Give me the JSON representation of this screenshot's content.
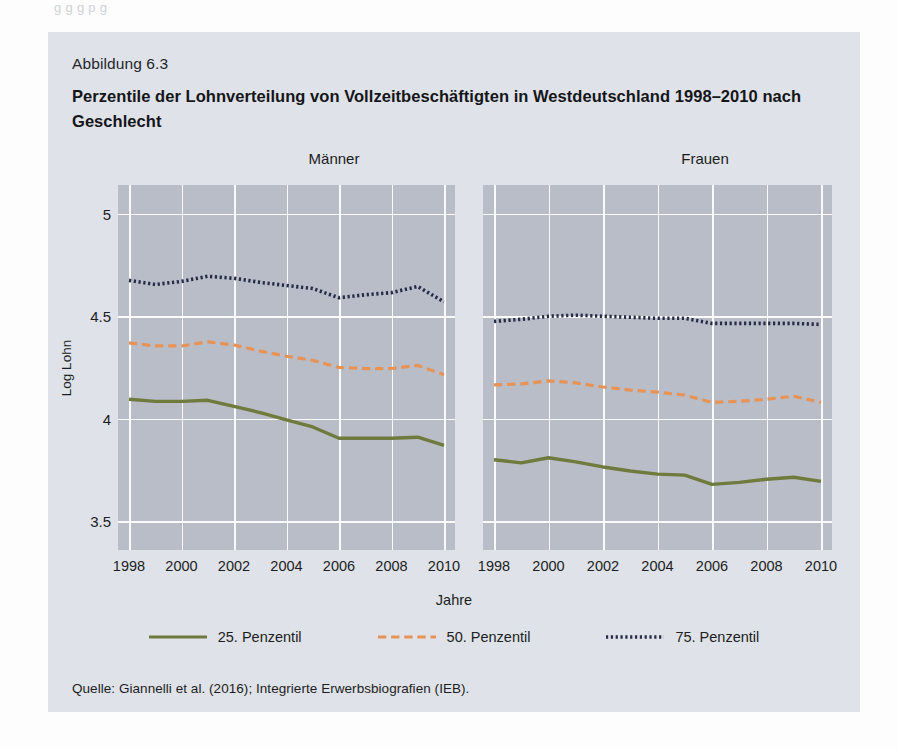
{
  "page_ghost_text": "g  g  g  p  g",
  "figure": {
    "number": "Abbildung 6.3",
    "title": "Perzentile der Lohnverteilung von Vollzeitbeschäftigten in Westdeutschland 1998–2010 nach Geschlecht",
    "source": "Quelle: Giannelli et al. (2016); Integrierte Erwerbsbiografien (IEB).",
    "background_color": "#dfe2e8",
    "plot_background_color": "#b9bdc8"
  },
  "chart_data": {
    "type": "line",
    "title": "Perzentile der Lohnverteilung von Vollzeitbeschäftigten in Westdeutschland 1998–2010 nach Geschlecht",
    "subtitle": "Abbildung 6.3",
    "xlabel": "Jahre",
    "ylabel": "Log Lohn",
    "x": [
      1998,
      1999,
      2000,
      2001,
      2002,
      2003,
      2004,
      2005,
      2006,
      2007,
      2008,
      2009,
      2010
    ],
    "xlim": [
      1998,
      2010
    ],
    "ylim": [
      3.36,
      5.14
    ],
    "yticks": [
      3.5,
      4,
      4.5,
      5
    ],
    "ytick_labels": [
      "3.5",
      "4",
      "4.5",
      "5"
    ],
    "xticks": [
      1998,
      2000,
      2002,
      2004,
      2006,
      2008,
      2010
    ],
    "xtick_labels": [
      "1998",
      "2000",
      "2002",
      "2004",
      "2006",
      "2008",
      "2010"
    ],
    "grid": true,
    "legend_position": "bottom",
    "panels": [
      {
        "name": "maenner",
        "label": "Männer",
        "series": [
          {
            "name": "25. Penzentil",
            "key": "p25",
            "color": "#6e7b3c",
            "style": "solid",
            "values": [
              4.095,
              4.085,
              4.085,
              4.09,
              4.06,
              4.03,
              3.995,
              3.96,
              3.905,
              3.905,
              3.905,
              3.91,
              3.87
            ]
          },
          {
            "name": "50. Penzentil",
            "key": "p50",
            "color": "#e79356",
            "style": "dashed",
            "values": [
              4.37,
              4.355,
              4.355,
              4.375,
              4.36,
              4.33,
              4.305,
              4.285,
              4.25,
              4.245,
              4.245,
              4.26,
              4.215
            ]
          },
          {
            "name": "75. Penzentil",
            "key": "p75",
            "color": "#262c44",
            "style": "dotted",
            "values": [
              4.675,
              4.655,
              4.67,
              4.695,
              4.685,
              4.665,
              4.65,
              4.635,
              4.59,
              4.605,
              4.615,
              4.645,
              4.57
            ]
          }
        ]
      },
      {
        "name": "frauen",
        "label": "Frauen",
        "series": [
          {
            "name": "25. Penzentil",
            "key": "p25",
            "color": "#6e7b3c",
            "style": "solid",
            "values": [
              3.8,
              3.785,
              3.81,
              3.79,
              3.765,
              3.745,
              3.73,
              3.725,
              3.68,
              3.69,
              3.705,
              3.715,
              3.695
            ]
          },
          {
            "name": "50. Penzentil",
            "key": "p50",
            "color": "#e79356",
            "style": "dashed",
            "values": [
              4.165,
              4.17,
              4.185,
              4.175,
              4.155,
              4.14,
              4.13,
              4.115,
              4.08,
              4.085,
              4.095,
              4.11,
              4.08
            ]
          },
          {
            "name": "75. Penzentil",
            "key": "p75",
            "color": "#262c44",
            "style": "dotted",
            "values": [
              4.475,
              4.485,
              4.5,
              4.505,
              4.5,
              4.495,
              4.49,
              4.49,
              4.465,
              4.465,
              4.465,
              4.465,
              4.46
            ]
          }
        ]
      }
    ],
    "legend": [
      {
        "label": "25. Penzentil",
        "color": "#6e7b3c",
        "style": "solid"
      },
      {
        "label": "50. Penzentil",
        "color": "#e79356",
        "style": "dashed"
      },
      {
        "label": "75. Penzentil",
        "color": "#262c44",
        "style": "dotted"
      }
    ]
  }
}
